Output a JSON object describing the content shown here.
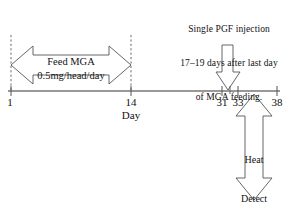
{
  "diagram": {
    "title_note": {
      "lines": [
        "Single PGF injection",
        "17–19 days after last day",
        "of MGA feeding."
      ]
    },
    "feed_arrow": {
      "line1": "Feed MGA",
      "line2": "0.5mg/head/day"
    },
    "breed_arrow": {
      "lines": [
        "Heat",
        "Detect",
        "&",
        "Breed"
      ]
    },
    "axis": {
      "label": "Day",
      "ticks": [
        {
          "value": "1",
          "x": 11
        },
        {
          "value": "14",
          "x": 131
        },
        {
          "value": "31",
          "x": 222
        },
        {
          "value": "33",
          "x": 238
        },
        {
          "value": "38",
          "x": 277
        }
      ]
    },
    "colors": {
      "stroke": "#555555",
      "text": "#111111",
      "background": "#ffffff"
    }
  }
}
